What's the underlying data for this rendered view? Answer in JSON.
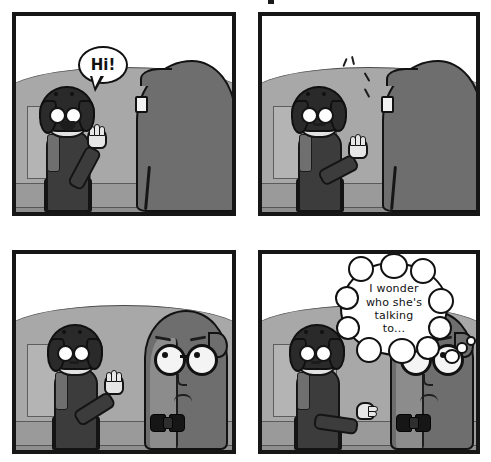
{
  "comic": {
    "title": "four-panel grayscale comic strip",
    "panel_count": 4,
    "palette": {
      "panel_border": "#161616",
      "page_background": "#ffffff",
      "wall": "#a8a8a8",
      "wall_shade": "#9a9a9a",
      "floor": "#8e8e8e",
      "creature_body": "#6e6e6e",
      "creature_highlight": "#8c8c8c",
      "woman_sweater": "#3c3c3c",
      "woman_skirt": "#6b6b6b",
      "woman_hair": "#2a2a2a",
      "woman_skin": "#e2e2e2",
      "bubble_fill": "#ffffff",
      "ink": "#111111"
    },
    "panels": [
      {
        "id": "panel-1",
        "number": 1,
        "label": "Panel 1",
        "description": "Smiling woman waves and greets the shaggy creature seen from behind.",
        "speech": {
          "type": "speech",
          "speaker": "woman",
          "text": "Hi!"
        },
        "characters": [
          {
            "name": "woman",
            "pose": "waving, smiling, mouth open"
          },
          {
            "name": "creature",
            "pose": "back view, glasses temple visible"
          }
        ]
      },
      {
        "id": "panel-2",
        "number": 2,
        "label": "Panel 2",
        "description": "Woman keeps waving with motion lines; creature still faces away.",
        "speech": null,
        "characters": [
          {
            "name": "woman",
            "pose": "waving with motion lines, slight smile"
          },
          {
            "name": "creature",
            "pose": "back view, glasses temple visible"
          }
        ]
      },
      {
        "id": "panel-3",
        "number": 3,
        "label": "Panel 3",
        "description": "Creature turns around revealing round glasses and bow tie; woman's smile fades.",
        "speech": null,
        "characters": [
          {
            "name": "woman",
            "pose": "hand raised, neutral mouth"
          },
          {
            "name": "creature",
            "pose": "front view, round glasses, bow tie, worried"
          }
        ]
      },
      {
        "id": "panel-4",
        "number": 4,
        "label": "Panel 4",
        "description": "Creature thinks a puzzled thought while the woman points toward it.",
        "speech": {
          "type": "thought",
          "speaker": "creature",
          "text": "I wonder who she's talking to...",
          "lines": [
            "I wonder",
            "who she's",
            "talking",
            "to..."
          ]
        },
        "characters": [
          {
            "name": "woman",
            "pose": "arm extended pointing, neutral mouth"
          },
          {
            "name": "creature",
            "pose": "front view, round glasses, bow tie, thinking"
          }
        ]
      }
    ]
  }
}
